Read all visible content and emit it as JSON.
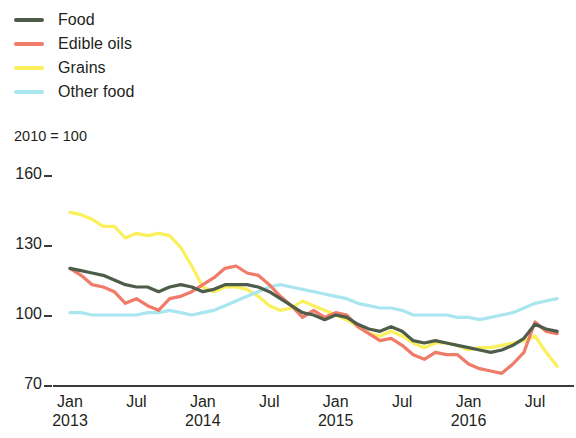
{
  "chart_data": {
    "type": "line",
    "title": "",
    "subtitle": "",
    "unit_note": "2010 = 100",
    "xlabel": "",
    "ylabel": "",
    "ylim": [
      70,
      160
    ],
    "yticks": [
      160,
      130,
      100,
      70
    ],
    "grid": false,
    "legend_position": "top-left",
    "xticks": [
      {
        "month": "Jan",
        "year": "2013"
      },
      {
        "month": "Jul",
        "year": ""
      },
      {
        "month": "Jan",
        "year": "2014"
      },
      {
        "month": "Jul",
        "year": ""
      },
      {
        "month": "Jan",
        "year": "2015"
      },
      {
        "month": "Jul",
        "year": ""
      },
      {
        "month": "Jan",
        "year": "2016"
      },
      {
        "month": "Jul",
        "year": ""
      }
    ],
    "x": [
      "2013-01",
      "2013-02",
      "2013-03",
      "2013-04",
      "2013-05",
      "2013-06",
      "2013-07",
      "2013-08",
      "2013-09",
      "2013-10",
      "2013-11",
      "2013-12",
      "2014-01",
      "2014-02",
      "2014-03",
      "2014-04",
      "2014-05",
      "2014-06",
      "2014-07",
      "2014-08",
      "2014-09",
      "2014-10",
      "2014-11",
      "2014-12",
      "2015-01",
      "2015-02",
      "2015-03",
      "2015-04",
      "2015-05",
      "2015-06",
      "2015-07",
      "2015-08",
      "2015-09",
      "2015-10",
      "2015-11",
      "2015-12",
      "2016-01",
      "2016-02",
      "2016-03",
      "2016-04",
      "2016-05",
      "2016-06",
      "2016-07",
      "2016-08",
      "2016-09"
    ],
    "xlim": [
      "2013-01",
      "2016-09"
    ],
    "series": [
      {
        "name": "Food",
        "color": "#4e5c4a",
        "values": [
          120,
          119,
          118,
          117,
          115,
          113,
          112,
          112,
          110,
          112,
          113,
          112,
          110,
          111,
          113,
          113,
          113,
          112,
          110,
          107,
          104,
          101,
          100,
          98,
          100,
          99,
          96,
          94,
          93,
          95,
          93,
          89,
          88,
          89,
          88,
          87,
          86,
          85,
          84,
          85,
          87,
          90,
          96,
          94,
          93
        ]
      },
      {
        "name": "Edible oils",
        "color": "#ef7b68",
        "values": [
          120,
          117,
          113,
          112,
          110,
          105,
          107,
          104,
          102,
          107,
          108,
          110,
          113,
          116,
          120,
          121,
          118,
          117,
          113,
          108,
          104,
          99,
          102,
          99,
          101,
          100,
          95,
          92,
          89,
          90,
          87,
          83,
          81,
          84,
          83,
          83,
          79,
          77,
          76,
          75,
          79,
          84,
          97,
          93,
          92
        ]
      },
      {
        "name": "Grains",
        "color": "#faf05c",
        "values": [
          144,
          143,
          141,
          138,
          138,
          133,
          135,
          134,
          135,
          134,
          129,
          121,
          112,
          110,
          112,
          112,
          111,
          108,
          104,
          102,
          103,
          106,
          104,
          102,
          100,
          98,
          95,
          92,
          91,
          93,
          91,
          88,
          86,
          88,
          88,
          87,
          85,
          86,
          86,
          87,
          88,
          89,
          91,
          84,
          78
        ]
      },
      {
        "name": "Other food",
        "color": "#aae6ef",
        "values": [
          101,
          101,
          100,
          100,
          100,
          100,
          100,
          101,
          101,
          102,
          101,
          100,
          101,
          102,
          104,
          106,
          108,
          110,
          112,
          113,
          112,
          111,
          110,
          109,
          108,
          107,
          105,
          104,
          103,
          103,
          102,
          100,
          100,
          100,
          100,
          99,
          99,
          98,
          99,
          100,
          101,
          103,
          105,
          106,
          107
        ]
      }
    ]
  },
  "legend": {
    "items": [
      {
        "label": "Food",
        "color": "#4e5c4a"
      },
      {
        "label": "Edible oils",
        "color": "#ef7b68"
      },
      {
        "label": "Grains",
        "color": "#faf05c"
      },
      {
        "label": "Other food",
        "color": "#aae6ef"
      }
    ]
  },
  "axes": {
    "unit_note": "2010 = 100",
    "y_labels": [
      "160",
      "130",
      "100",
      "70"
    ],
    "x_labels": [
      {
        "month": "Jan",
        "year": "2013"
      },
      {
        "month": "Jul",
        "year": ""
      },
      {
        "month": "Jan",
        "year": "2014"
      },
      {
        "month": "Jul",
        "year": ""
      },
      {
        "month": "Jan",
        "year": "2015"
      },
      {
        "month": "Jul",
        "year": ""
      },
      {
        "month": "Jan",
        "year": "2016"
      },
      {
        "month": "Jul",
        "year": ""
      }
    ]
  }
}
